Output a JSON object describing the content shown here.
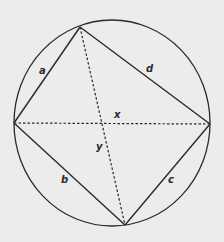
{
  "diagram": {
    "type": "cyclic-quadrilateral",
    "colors": {
      "background": "#ececec",
      "stroke": "#2a2a2a"
    },
    "circle": {
      "cx": 112,
      "cy": 123,
      "rx": 98,
      "ry": 103
    },
    "vertices": {
      "top": [
        80,
        27
      ],
      "left": [
        14,
        123
      ],
      "right": [
        210,
        124
      ],
      "bottom": [
        125,
        225
      ]
    },
    "sides": [
      {
        "name": "a",
        "label": "a",
        "from": "left",
        "to": "top",
        "label_pos": [
          42,
          73
        ]
      },
      {
        "name": "d",
        "label": "d",
        "from": "top",
        "to": "right",
        "label_pos": [
          148,
          71
        ]
      },
      {
        "name": "c",
        "label": "c",
        "from": "right",
        "to": "bottom",
        "label_pos": [
          169,
          183
        ]
      },
      {
        "name": "b",
        "label": "b",
        "from": "bottom",
        "to": "left",
        "label_pos": [
          63,
          183
        ]
      }
    ],
    "diagonals": [
      {
        "name": "x",
        "label": "x",
        "from": "left",
        "to": "right",
        "style": "dashed",
        "label_pos": [
          115,
          118
        ]
      },
      {
        "name": "y",
        "label": "y",
        "from": "top",
        "to": "bottom",
        "style": "dashed",
        "label_pos": [
          97,
          149
        ]
      }
    ]
  }
}
